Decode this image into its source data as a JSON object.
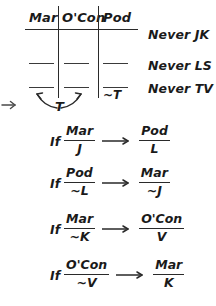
{
  "diagram": {
    "type": "logic-game-setup",
    "table": {
      "columns": [
        "Mar",
        "O'Con",
        "Pod"
      ],
      "rows": 2,
      "slot_marks": [
        [
          "",
          "",
          ""
        ],
        [
          "",
          "",
          ""
        ]
      ],
      "annotations": {
        "pod_lower_slot": "~T",
        "center_below": "T"
      }
    },
    "constraints": [
      {
        "label": "Never JK"
      },
      {
        "label": "Never LS"
      },
      {
        "label": "Never TV"
      }
    ],
    "rules": [
      {
        "if_word": "If",
        "antecedent": {
          "top": "Mar",
          "bottom": "J"
        },
        "arrow": "implies-arrow",
        "consequent": {
          "top": "Pod",
          "bottom": "L"
        }
      },
      {
        "if_word": "If",
        "antecedent": {
          "top": "Pod",
          "bottom": "~L"
        },
        "arrow": "implies-arrow",
        "consequent": {
          "top": "Mar",
          "bottom": "~J"
        }
      },
      {
        "if_word": "If",
        "antecedent": {
          "top": "Mar",
          "bottom": "~K"
        },
        "arrow": "implies-arrow",
        "consequent": {
          "top": "O'Con",
          "bottom": "V"
        }
      },
      {
        "if_word": "If",
        "antecedent": {
          "top": "O'Con",
          "bottom": "~V"
        },
        "arrow": "implies-arrow",
        "consequent": {
          "top": "Mar",
          "bottom": "K"
        }
      }
    ],
    "icons": {
      "margin_arrow": "right-arrow-icon",
      "curved_arrows": "curved-double-arrow-icon"
    },
    "colors": {
      "ink": "#1a1a1a",
      "rule_line": "#2a2a2a",
      "background": "#ffffff"
    }
  }
}
